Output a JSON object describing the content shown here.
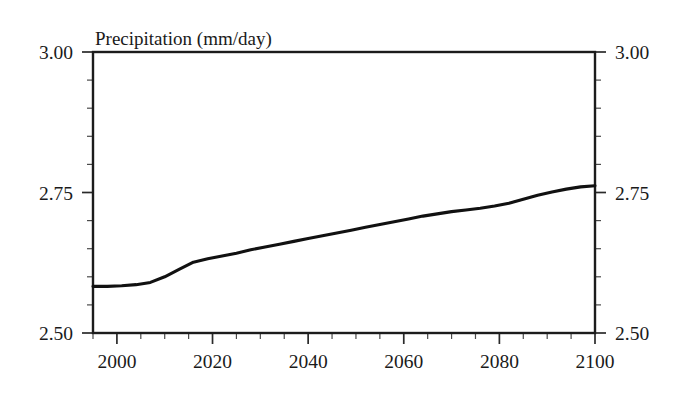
{
  "chart_data": {
    "type": "line",
    "title": "Precipitation (mm/day)",
    "xlabel": "",
    "ylabel": "",
    "xlim": [
      1995,
      2100
    ],
    "ylim": [
      2.5,
      3.0
    ],
    "grid": false,
    "legend": null,
    "y_ticks_major": [
      "3.00",
      "2.75",
      "2.50"
    ],
    "y_tick_values": [
      3.0,
      2.75,
      2.5
    ],
    "y_minor_step": 0.05,
    "x_ticks_major": [
      "2000",
      "2020",
      "2040",
      "2060",
      "2080",
      "2100"
    ],
    "x_tick_values": [
      2000,
      2020,
      2040,
      2060,
      2080,
      2100
    ],
    "x_minor_step": 5,
    "axes_right_labels": [
      "3.00",
      "2.75",
      "2.50"
    ],
    "series": [
      {
        "name": "Precipitation",
        "color": "#111111",
        "x": [
          1995,
          1998,
          2001,
          2004,
          2007,
          2010,
          2013,
          2016,
          2019,
          2022,
          2025,
          2028,
          2031,
          2034,
          2037,
          2040,
          2043,
          2046,
          2049,
          2052,
          2055,
          2058,
          2061,
          2064,
          2067,
          2070,
          2073,
          2076,
          2079,
          2082,
          2085,
          2088,
          2091,
          2094,
          2097,
          2100
        ],
        "y": [
          2.583,
          2.583,
          2.584,
          2.586,
          2.59,
          2.6,
          2.613,
          2.626,
          2.632,
          2.637,
          2.642,
          2.648,
          2.653,
          2.658,
          2.663,
          2.668,
          2.673,
          2.678,
          2.683,
          2.688,
          2.693,
          2.698,
          2.703,
          2.708,
          2.712,
          2.716,
          2.719,
          2.722,
          2.726,
          2.731,
          2.738,
          2.745,
          2.751,
          2.756,
          2.76,
          2.762
        ]
      }
    ]
  }
}
